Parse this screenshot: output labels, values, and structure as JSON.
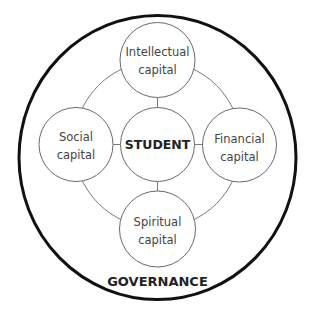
{
  "diagram": {
    "outer_label": "GOVERNANCE",
    "center": {
      "label": "STUDENT"
    },
    "nodes": [
      {
        "id": "intellectual",
        "line1": "Intellectual",
        "line2": "capital",
        "position": "top"
      },
      {
        "id": "social",
        "line1": "Social",
        "line2": "capital",
        "position": "left"
      },
      {
        "id": "financial",
        "line1": "Financial",
        "line2": "capital",
        "position": "right"
      },
      {
        "id": "spiritual",
        "line1": "Spiritual",
        "line2": "capital",
        "position": "bottom"
      }
    ],
    "colors": {
      "outer_stroke": "#111111",
      "node_stroke": "#6a6a6a",
      "text": "#444444",
      "bold_text": "#222222",
      "background": "#ffffff"
    }
  }
}
